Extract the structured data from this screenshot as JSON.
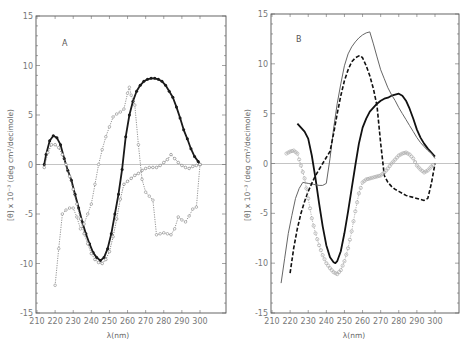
{
  "chart_data": [
    {
      "panel": "A",
      "type": "line",
      "title": "",
      "panel_label": "A",
      "xlabel": "λ(nm)",
      "ylabel": "[θ] x 10⁻³ (deg  cm²/decimole)",
      "xlim": [
        210,
        310
      ],
      "ylim": [
        -15,
        15
      ],
      "xticks": [
        210,
        220,
        230,
        240,
        250,
        260,
        270,
        280,
        290,
        300
      ],
      "yticks": [
        -15,
        -10,
        -5,
        0,
        5,
        10,
        15
      ],
      "grid": false,
      "zero_line": true,
      "series": [
        {
          "name": "solid-filled-circles",
          "style": "solid-bold-filled-markers",
          "color": "#1a1a1a",
          "x": [
            214,
            215,
            217,
            219,
            221,
            223,
            225,
            227,
            229,
            231,
            233,
            235,
            237,
            239,
            241,
            243,
            245,
            247,
            249,
            251,
            253,
            255,
            257,
            259,
            261,
            263,
            265,
            267,
            269,
            271,
            273,
            275,
            277,
            279,
            281,
            283,
            285,
            287,
            289,
            291,
            293,
            295,
            297,
            299,
            300
          ],
          "y": [
            0,
            1.0,
            2.4,
            2.9,
            2.7,
            2.0,
            0.6,
            -0.6,
            -1.6,
            -3.0,
            -4.4,
            -5.8,
            -7.0,
            -8.0,
            -8.9,
            -9.4,
            -9.7,
            -9.4,
            -8.5,
            -7.0,
            -5.0,
            -3.0,
            -0.5,
            2.8,
            5.0,
            6.4,
            7.4,
            8.0,
            8.4,
            8.6,
            8.7,
            8.7,
            8.6,
            8.4,
            8.0,
            7.4,
            6.8,
            5.8,
            4.7,
            3.5,
            2.6,
            1.6,
            0.8,
            0.3,
            0
          ]
        },
        {
          "name": "dotted-open-circles-1",
          "style": "dotted-open-markers",
          "color": "#777777",
          "x": [
            214,
            216,
            218,
            220,
            222,
            224,
            226,
            228,
            230,
            232,
            234,
            236,
            238,
            240,
            242,
            244,
            246,
            248,
            250,
            252,
            254,
            256,
            258,
            260,
            262,
            264,
            266,
            268,
            270,
            272,
            274,
            276,
            278,
            280,
            282,
            284,
            286,
            288,
            290,
            292,
            294,
            296,
            298,
            300
          ],
          "y": [
            -0.3,
            1.2,
            2.0,
            2.0,
            1.7,
            1.0,
            0,
            -1.2,
            -2.5,
            -4.0,
            -5.5,
            -7.0,
            -8.0,
            -9.0,
            -9.6,
            -9.9,
            -10.0,
            -9.6,
            -8.8,
            -7.3,
            -5.5,
            -3.5,
            -2.0,
            -1.7,
            -1.4,
            -1.1,
            -0.9,
            -0.6,
            -0.4,
            -0.3,
            -0.3,
            -0.3,
            -0.1,
            0.2,
            0.5,
            1.0,
            0.6,
            0.2,
            -0.1,
            -0.3,
            -0.4,
            -0.2,
            -0.1,
            0
          ]
        },
        {
          "name": "dotted-open-circles-2",
          "style": "dotted-open-markers",
          "color": "#888888",
          "x": [
            220,
            222,
            224,
            226,
            228,
            230,
            232,
            234,
            236,
            238,
            240,
            242,
            244,
            246,
            248,
            250,
            252,
            254,
            256,
            258,
            260,
            261,
            262,
            264,
            266,
            268,
            270,
            272,
            274,
            276,
            278,
            280,
            282,
            284,
            286,
            288,
            290,
            292,
            294,
            296,
            298,
            300
          ],
          "y": [
            -12.2,
            -8.5,
            -5.0,
            -4.6,
            -4.4,
            -4.4,
            -5.3,
            -6.5,
            -6.0,
            -5.0,
            -4.0,
            -2.0,
            0,
            1.5,
            2.8,
            3.8,
            4.8,
            5.1,
            5.3,
            5.6,
            7.2,
            7.8,
            7.0,
            6.0,
            2.0,
            -1.5,
            -2.8,
            -3.2,
            -3.6,
            -7.1,
            -7.0,
            -6.9,
            -7.0,
            -7.1,
            -6.5,
            -5.3,
            -5.6,
            -5.8,
            -5.2,
            -4.5,
            -4.3,
            0
          ]
        }
      ]
    },
    {
      "panel": "B",
      "type": "line",
      "title": "",
      "panel_label": "B",
      "xlabel": "λ(nm)",
      "ylabel": "[θ] x 10⁻³ (deg  cm²/decimole)",
      "xlim": [
        210,
        310
      ],
      "ylim": [
        -15,
        15
      ],
      "xticks": [
        210,
        220,
        230,
        240,
        250,
        260,
        270,
        280,
        290,
        300
      ],
      "yticks": [
        -15,
        -10,
        -5,
        0,
        5,
        10,
        15
      ],
      "grid": false,
      "zero_line": true,
      "series": [
        {
          "name": "solid-bold",
          "style": "solid-bold",
          "color": "#111111",
          "x": [
            224,
            226,
            228,
            230,
            232,
            234,
            236,
            238,
            240,
            242,
            244,
            245,
            246,
            248,
            250,
            252,
            254,
            256,
            258,
            260,
            262,
            264,
            266,
            268,
            270,
            272,
            274,
            276,
            278,
            280,
            282,
            284,
            286,
            288,
            290,
            292,
            294,
            296,
            298,
            300
          ],
          "y": [
            4.0,
            3.6,
            3.2,
            2.5,
            0.8,
            -1.5,
            -4.0,
            -6.3,
            -8.2,
            -9.4,
            -9.9,
            -10.0,
            -9.8,
            -8.8,
            -7.0,
            -4.8,
            -2.5,
            -0.2,
            2.0,
            3.6,
            4.5,
            5.2,
            5.6,
            6.0,
            6.3,
            6.5,
            6.6,
            6.8,
            6.9,
            7.0,
            6.8,
            6.3,
            5.5,
            4.5,
            3.4,
            2.6,
            2.0,
            1.5,
            1.1,
            0.7
          ]
        },
        {
          "name": "thin-solid",
          "style": "thin-solid",
          "color": "#666666",
          "x": [
            215,
            217,
            219,
            221,
            223,
            225,
            227,
            230,
            233,
            236,
            238,
            240,
            242,
            244,
            246,
            248,
            250,
            252,
            254,
            256,
            258,
            260,
            262,
            264,
            266,
            268,
            270,
            272,
            274,
            276,
            278,
            280,
            282,
            284,
            286,
            288,
            290,
            292,
            294,
            296,
            298,
            300
          ],
          "y": [
            -12.0,
            -9.5,
            -7.0,
            -5.2,
            -3.5,
            -2.5,
            -1.9,
            -2.0,
            -2.1,
            -2.2,
            -2.2,
            -2.0,
            0.5,
            3.5,
            6.0,
            8.0,
            9.8,
            11.0,
            11.7,
            12.2,
            12.6,
            12.9,
            13.1,
            13.2,
            12.0,
            10.7,
            9.4,
            8.5,
            7.6,
            6.9,
            6.3,
            5.6,
            5.0,
            4.4,
            3.8,
            3.2,
            2.6,
            2.1,
            1.7,
            1.3,
            1.0,
            0.5
          ]
        },
        {
          "name": "dashed",
          "style": "dashed-bold",
          "color": "#111111",
          "x": [
            220,
            222,
            224,
            226,
            228,
            230,
            232,
            234,
            236,
            238,
            240,
            242,
            244,
            246,
            248,
            250,
            252,
            254,
            256,
            258,
            259,
            260,
            262,
            264,
            266,
            268,
            270,
            272,
            274,
            276,
            278,
            280,
            282,
            284,
            286,
            288,
            290,
            292,
            294,
            296,
            298,
            300
          ],
          "y": [
            -11.0,
            -8.5,
            -6.5,
            -5.0,
            -3.8,
            -2.8,
            -2.0,
            -1.2,
            -0.6,
            0,
            0.6,
            1.2,
            3.0,
            5.0,
            6.8,
            8.3,
            9.4,
            10.2,
            10.6,
            10.8,
            10.8,
            10.6,
            9.8,
            8.8,
            7.5,
            5.8,
            2.0,
            -1.2,
            -1.9,
            -2.3,
            -2.6,
            -2.8,
            -3.0,
            -3.2,
            -3.3,
            -3.4,
            -3.5,
            -3.6,
            -3.7,
            -3.5,
            -2.0,
            0
          ]
        },
        {
          "name": "dotted-open-circles",
          "style": "dotted-open-markers-light",
          "color": "#aaaaaa",
          "x": [
            218,
            220,
            222,
            224,
            226,
            228,
            230,
            232,
            234,
            236,
            238,
            240,
            242,
            244,
            246,
            248,
            250,
            252,
            254,
            256,
            258,
            260,
            262,
            264,
            266,
            268,
            270,
            272,
            274,
            276,
            278,
            280,
            282,
            284,
            286,
            288,
            290,
            292,
            294,
            296,
            298,
            300
          ],
          "y": [
            1.0,
            1.2,
            1.3,
            1.0,
            -0.2,
            -1.5,
            -3.5,
            -5.5,
            -7.0,
            -8.2,
            -9.2,
            -10.0,
            -10.5,
            -10.9,
            -11.1,
            -10.7,
            -9.8,
            -8.5,
            -6.8,
            -4.8,
            -3.0,
            -1.9,
            -1.6,
            -1.5,
            -1.4,
            -1.3,
            -1.2,
            -0.9,
            -0.5,
            0,
            0.4,
            0.8,
            1.0,
            1.1,
            0.9,
            0.5,
            -0.2,
            -0.6,
            -0.9,
            -0.7,
            -0.3,
            0
          ]
        }
      ]
    }
  ],
  "panels": [
    {
      "label": "A",
      "xlabel": "λ(nm)",
      "ylabel_theta": "θ",
      "ylabel_rest": "x 10⁻³ (deg  cm²/decimole)"
    },
    {
      "label": "B",
      "xlabel": "λ(nm)",
      "ylabel_theta": "θ",
      "ylabel_rest": "x 10⁻³ (deg  cm²/decimole)"
    }
  ],
  "layout": [
    {
      "x0": 36,
      "x1": 226,
      "y0": 16,
      "y1": 313,
      "xpx210": 37,
      "xpx300": 200
    },
    {
      "x0": 271,
      "x1": 459,
      "y0": 14,
      "y1": 313,
      "xpx210": 272,
      "xpx300": 435
    }
  ]
}
